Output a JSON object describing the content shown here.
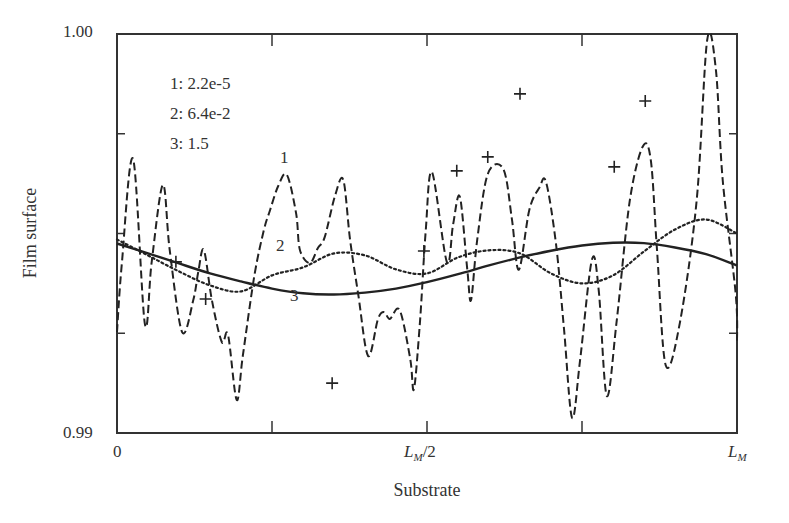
{
  "chart_data": {
    "type": "line",
    "title": "",
    "xlabel": "Substrate",
    "ylabel": "Film surface",
    "x_ticks": [
      {
        "label": "0",
        "pos": 0.0
      },
      {
        "label": "",
        "pos": 0.25
      },
      {
        "label": "L_M/2",
        "pos": 0.5
      },
      {
        "label": "",
        "pos": 0.75
      },
      {
        "label": "L_M",
        "pos": 1.0
      }
    ],
    "y_ticks": [
      {
        "label": "0.99",
        "value": 0.99
      },
      {
        "label": "",
        "value": 0.9925
      },
      {
        "label": "",
        "value": 0.995
      },
      {
        "label": "",
        "value": 0.9975
      },
      {
        "label": "1.00",
        "value": 1.0
      }
    ],
    "xlim": [
      0,
      1
    ],
    "ylim": [
      0.99,
      1.0
    ],
    "grid": false,
    "legend": {
      "position": "upper-left (inside)",
      "entries": [
        {
          "id": "1",
          "text": "1: 2.2e-5"
        },
        {
          "id": "2",
          "text": "2: 6.4e-2"
        },
        {
          "id": "3",
          "text": "3: 1.5"
        }
      ]
    },
    "annotations": [
      {
        "text": "1",
        "x": 0.27,
        "y": 0.997
      },
      {
        "text": "2",
        "x": 0.22,
        "y": 0.9952
      },
      {
        "text": "3",
        "x": 0.29,
        "y": 0.9935
      }
    ],
    "series": [
      {
        "name": "1: 2.2e-5",
        "style": "dashed",
        "x": [
          0.0,
          0.008,
          0.026,
          0.045,
          0.056,
          0.074,
          0.085,
          0.105,
          0.123,
          0.131,
          0.14,
          0.153,
          0.169,
          0.179,
          0.193,
          0.203,
          0.222,
          0.237,
          0.247,
          0.26,
          0.274,
          0.289,
          0.295,
          0.311,
          0.324,
          0.335,
          0.352,
          0.365,
          0.376,
          0.389,
          0.405,
          0.421,
          0.431,
          0.44,
          0.456,
          0.473,
          0.479,
          0.489,
          0.498,
          0.508,
          0.532,
          0.542,
          0.553,
          0.565,
          0.571,
          0.581,
          0.598,
          0.623,
          0.637,
          0.648,
          0.665,
          0.681,
          0.692,
          0.708,
          0.721,
          0.734,
          0.747,
          0.766,
          0.777,
          0.79,
          0.806,
          0.827,
          0.848,
          0.861,
          0.871,
          0.885,
          0.908,
          0.935,
          0.952,
          0.966,
          0.977,
          0.998,
          1.0
        ],
        "values": [
          0.99253,
          0.99429,
          0.99687,
          0.99273,
          0.99429,
          0.99622,
          0.99459,
          0.99253,
          0.99333,
          0.99403,
          0.99459,
          0.99333,
          0.99228,
          0.99246,
          0.99083,
          0.99195,
          0.99398,
          0.99509,
          0.99559,
          0.99619,
          0.99647,
          0.99549,
          0.99459,
          0.99426,
          0.99464,
          0.99491,
          0.99596,
          0.99634,
          0.99484,
          0.99348,
          0.99193,
          0.99286,
          0.99303,
          0.99286,
          0.99308,
          0.99185,
          0.9911,
          0.99286,
          0.99509,
          0.99654,
          0.99429,
          0.99521,
          0.99592,
          0.99409,
          0.99333,
          0.99484,
          0.99649,
          0.99662,
          0.99536,
          0.99409,
          0.99559,
          0.99614,
          0.99629,
          0.99474,
          0.99261,
          0.99038,
          0.99183,
          0.99434,
          0.99358,
          0.99093,
          0.99281,
          0.99581,
          0.99718,
          0.99684,
          0.99459,
          0.9917,
          0.99278,
          0.99584,
          0.99985,
          0.9991,
          0.99634,
          0.99346,
          0.99223
        ]
      },
      {
        "name": "2: 6.4e-2",
        "style": "dotted",
        "x": [
          0.0,
          0.05,
          0.1,
          0.15,
          0.2,
          0.25,
          0.3,
          0.35,
          0.4,
          0.45,
          0.5,
          0.55,
          0.6,
          0.65,
          0.7,
          0.75,
          0.8,
          0.85,
          0.9,
          0.95,
          1.0
        ],
        "values": [
          0.99485,
          0.99445,
          0.99405,
          0.9937,
          0.99355,
          0.99395,
          0.99415,
          0.9945,
          0.99445,
          0.9941,
          0.994,
          0.9944,
          0.99458,
          0.9945,
          0.994,
          0.99375,
          0.99395,
          0.99455,
          0.9951,
          0.99535,
          0.995
        ]
      },
      {
        "name": "3: 1.5",
        "style": "solid",
        "x": [
          0.0,
          0.05,
          0.1,
          0.15,
          0.2,
          0.25,
          0.3,
          0.35,
          0.4,
          0.45,
          0.5,
          0.55,
          0.6,
          0.65,
          0.7,
          0.75,
          0.8,
          0.85,
          0.9,
          0.95,
          1.0
        ],
        "values": [
          0.99475,
          0.9945,
          0.99425,
          0.994,
          0.9938,
          0.99362,
          0.9935,
          0.99347,
          0.99352,
          0.99362,
          0.99378,
          0.99398,
          0.9942,
          0.9944,
          0.99457,
          0.9947,
          0.99477,
          0.99476,
          0.99465,
          0.99448,
          0.9942
        ]
      },
      {
        "name": "data points (+)",
        "style": "markers",
        "marker": "plus",
        "x": [
          0.095,
          0.143,
          0.347,
          0.495,
          0.548,
          0.598,
          0.65,
          0.802,
          0.852
        ],
        "values": [
          0.99429,
          0.99336,
          0.99125,
          0.99456,
          0.99657,
          0.99692,
          0.9985,
          0.99667,
          0.99832
        ]
      }
    ]
  },
  "axes": {
    "y_top_label": "1.00",
    "y_bottom_label": "0.99",
    "x_left_label": "0",
    "x_mid_label_main": "L",
    "x_mid_label_sub": "M",
    "x_mid_label_suffix": "/2",
    "x_right_label_main": "L",
    "x_right_label_sub": "M"
  },
  "labels": {
    "xlabel": "Substrate",
    "ylabel": "Film surface",
    "legend": [
      "1: 2.2e-5",
      "2: 6.4e-2",
      "3: 1.5"
    ],
    "curve_tags": [
      "1",
      "2",
      "3"
    ]
  },
  "colors": {
    "line": "#222222",
    "axis": "#333333",
    "text": "#333333",
    "background": "#ffffff"
  }
}
